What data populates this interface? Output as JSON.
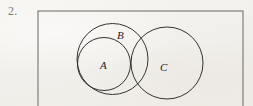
{
  "figure": {
    "problem_number": "2.",
    "background_color": "#f4f2ee",
    "ink_color": "#2b2927",
    "frame_color": "#6b6864",
    "width": 253,
    "height": 106
  },
  "frame": {
    "name": "figure-border-rectangle",
    "x": 38,
    "y": 11,
    "width": 205,
    "height": 98
  },
  "sets": {
    "A": {
      "label": "A",
      "cx": 104,
      "cy": 64,
      "r": 26.5,
      "label_x": 100,
      "label_y": 60
    },
    "B": {
      "label": "B",
      "cx": 112.5,
      "cy": 59,
      "r": 35.5,
      "label_x": 117,
      "label_y": 30
    },
    "C": {
      "label": "C",
      "cx": 167,
      "cy": 63,
      "r": 36,
      "label_x": 160,
      "label_y": 62
    }
  },
  "relations": {
    "a_subset_b": "A is contained within B",
    "b_intersects_c": "B and C overlap",
    "a_disjoint_c": "A and C do not overlap"
  }
}
